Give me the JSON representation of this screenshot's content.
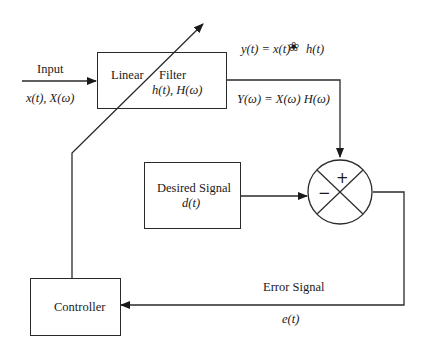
{
  "diagram": {
    "type": "adaptive-filter-block-diagram",
    "input": {
      "label": "Input",
      "signal": "x(t), X(ω)"
    },
    "filter_block": {
      "label_left": "Linear",
      "label_right": "Filter",
      "signal": "h(t), H(ω)"
    },
    "output": {
      "time_eq_left": "y(t) = x(t)",
      "convolution_symbol": "❀",
      "time_eq_right": "h(t)",
      "freq_eq": "Y(ω) = X(ω) H(ω)"
    },
    "desired_block": {
      "label": "Desired Signal",
      "signal": "d(t)"
    },
    "summing_junction": {
      "plus_sign": "+",
      "minus_sign": "−"
    },
    "error": {
      "label": "Error Signal",
      "signal": "e(t)"
    },
    "controller_block": {
      "label": "Controller"
    },
    "colors": {
      "stroke": "#2a2a2a",
      "background": "#ffffff",
      "text": "#1a1a1a"
    }
  }
}
